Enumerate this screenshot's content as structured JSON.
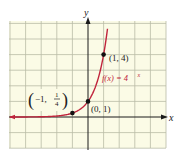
{
  "chart_data": {
    "type": "line",
    "title": "",
    "function_label": "f(x) = 4^x",
    "function_label_parts": {
      "base": "f(x) = 4",
      "exponent": "x"
    },
    "xlabel": "x",
    "ylabel": "y",
    "xlim": [
      -5,
      5
    ],
    "ylim": [
      -2,
      6
    ],
    "grid": true,
    "grid_step": 1,
    "series": [
      {
        "name": "f(x) = 4^x",
        "color": "#c0243c",
        "x": [
          -5,
          -4,
          -3,
          -2,
          -1.5,
          -1,
          -0.5,
          0,
          0.5,
          1,
          1.25
        ],
        "y": [
          0.001,
          0.004,
          0.016,
          0.0625,
          0.125,
          0.25,
          0.5,
          1,
          2,
          4,
          5.66
        ]
      }
    ],
    "points": [
      {
        "x": -1,
        "y": 0.25,
        "label": "(-1, 1/4)"
      },
      {
        "x": 0,
        "y": 1,
        "label": "(0, 1)"
      },
      {
        "x": 1,
        "y": 4,
        "label": "(1, 4)"
      }
    ]
  },
  "labels": {
    "x_axis": "x",
    "y_axis": "y",
    "point_a": {
      "open": "(",
      "text": "−1, ",
      "num": "1",
      "den": "4",
      "close": ")"
    },
    "point_b": "(0, 1)",
    "point_c": "(1, 4)",
    "func_main": "f(x) = 4",
    "func_exp": "x"
  },
  "colors": {
    "grid_bg": "#fbfbe6",
    "grid_line": "#b9bba6",
    "axis": "#1a1a1a",
    "curve": "#c0243c",
    "point": "#111111",
    "func_label": "#c0243c"
  }
}
